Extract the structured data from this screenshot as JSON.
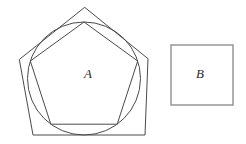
{
  "labels": {
    "shape_a": "A",
    "shape_b": "B"
  },
  "colors": {
    "line": "#4a4a4a",
    "square_line": "#8f8f8f",
    "background": "#ffffff"
  },
  "shapes": {
    "outer_pentagon_points": "84.7,7.3 148,58.7 145,135 33,135 19.3,59.5",
    "circle_cx": "84",
    "circle_cy": "78.5",
    "circle_r": "56.5",
    "inner_pentagon_points": "84,22 137.7,61 117.2,124.2 50.8,124.2 30.3,61",
    "square_x": "171",
    "square_y": "45",
    "square_w": "62",
    "square_h": "60"
  }
}
